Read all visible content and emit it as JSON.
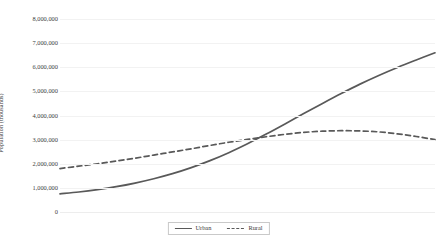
{
  "chart_data": {
    "type": "line",
    "title": "",
    "xlabel": "",
    "ylabel": "Population (thousands)",
    "ylim": [
      0,
      8000000
    ],
    "ytick_labels": [
      "8,000,000",
      "7,000,000",
      "6,000,000",
      "5,000,000",
      "4,000,000",
      "3,000,000",
      "2,000,000",
      "1,000,000",
      "0"
    ],
    "ytick_values": [
      8000000,
      7000000,
      6000000,
      5000000,
      4000000,
      3000000,
      2000000,
      1000000,
      0
    ],
    "xtick_labels": [],
    "grid": true,
    "legend_position": "bottom-center",
    "x": [
      0,
      1,
      2,
      3,
      4,
      5,
      6,
      7,
      8,
      9,
      10,
      11,
      12,
      13,
      14,
      15,
      16,
      17,
      18,
      19,
      20
    ],
    "series": [
      {
        "name": "Urban",
        "style": "solid",
        "color": "#595959",
        "values": [
          750000,
          830000,
          930000,
          1050000,
          1200000,
          1380000,
          1590000,
          1840000,
          2130000,
          2460000,
          2830000,
          3230000,
          3650000,
          4080000,
          4500000,
          4910000,
          5300000,
          5660000,
          5990000,
          6300000,
          6600000
        ]
      },
      {
        "name": "Rural",
        "style": "dashed",
        "color": "#595959",
        "values": [
          1800000,
          1900000,
          2000000,
          2110000,
          2230000,
          2360000,
          2490000,
          2620000,
          2760000,
          2890000,
          3010000,
          3120000,
          3220000,
          3300000,
          3350000,
          3370000,
          3360000,
          3320000,
          3240000,
          3130000,
          3000000
        ]
      }
    ],
    "legend": [
      {
        "label": "Urban",
        "style": "solid"
      },
      {
        "label": "Rural",
        "style": "dashed"
      }
    ]
  }
}
